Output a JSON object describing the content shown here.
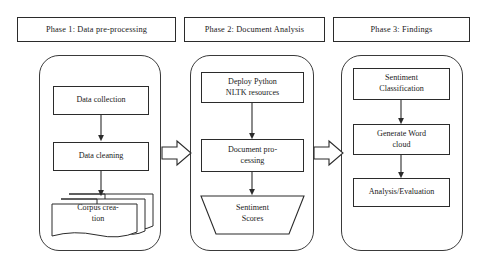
{
  "diagram": {
    "type": "flowchart",
    "stroke_color": "#2b2b2b",
    "background_color": "#ffffff"
  },
  "phases": [
    {
      "header": "Phase 1: Data pre-processing",
      "nodes": [
        {
          "label": "Data collection",
          "shape": "rectangle"
        },
        {
          "label": "Data cleaning",
          "shape": "rectangle"
        },
        {
          "label_line1": "Corpus crea-",
          "label_line2": "tion",
          "shape": "multi-document"
        }
      ]
    },
    {
      "header": "Phase 2: Document Analysis",
      "nodes": [
        {
          "label_line1": "Deploy Python",
          "label_line2": "NLTK resources",
          "shape": "rectangle"
        },
        {
          "label_line1": "Document pro-",
          "label_line2": "cessing",
          "shape": "rectangle"
        },
        {
          "label_line1": "Sentiment",
          "label_line2": "Scores",
          "shape": "trapezoid"
        }
      ]
    },
    {
      "header": "Phase 3: Findings",
      "nodes": [
        {
          "label_line1": "Sentiment",
          "label_line2": "Classification",
          "shape": "rectangle"
        },
        {
          "label_line1": "Generate Word",
          "label_line2": "cloud",
          "shape": "rectangle"
        },
        {
          "label": "Analysis/Evaluation",
          "shape": "rectangle"
        }
      ]
    }
  ],
  "connectors": {
    "vertical_arrows": 6,
    "block_arrows": 2,
    "direction": "downward within phase, rightward between phases"
  }
}
